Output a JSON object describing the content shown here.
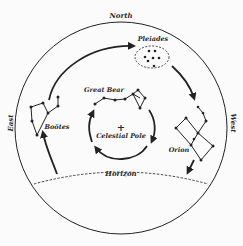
{
  "diagram": {
    "directions": {
      "north": "North",
      "east": "East",
      "west": "West"
    },
    "horizon_label": "Horizon",
    "pole_symbol": "+",
    "pole_label": "Celestial Pole",
    "constellations": [
      {
        "id": "pleiades",
        "label": "Pleiades"
      },
      {
        "id": "great-bear",
        "label": "Great Bear"
      },
      {
        "id": "bootes",
        "label": "Boötes"
      },
      {
        "id": "orion",
        "label": "Orion"
      }
    ],
    "colors": {
      "ink": "#222222",
      "background": "#fbfbfb"
    }
  }
}
